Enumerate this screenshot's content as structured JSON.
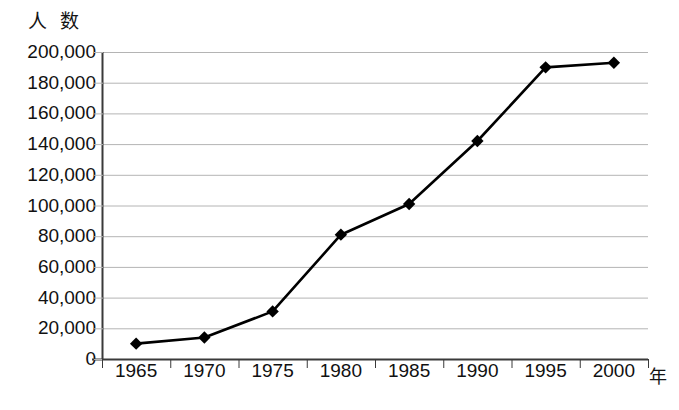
{
  "chart_data": {
    "type": "line",
    "title": "",
    "xlabel": "年",
    "ylabel": "人 数",
    "categories": [
      "1965",
      "1970",
      "1975",
      "1980",
      "1985",
      "1990",
      "1995",
      "2000"
    ],
    "x": [
      1965,
      1970,
      1975,
      1980,
      1985,
      1990,
      1995,
      2000
    ],
    "values": [
      10000,
      14000,
      31000,
      81000,
      101000,
      142000,
      190000,
      193000
    ],
    "series": [
      {
        "name": "人数",
        "values": [
          10000,
          14000,
          31000,
          81000,
          101000,
          142000,
          190000,
          193000
        ]
      }
    ],
    "ylim": [
      0,
      200000
    ],
    "ytick_labels": [
      "200,000",
      "180,000",
      "160,000",
      "140,000",
      "120,000",
      "100,000",
      "80,000",
      "60,000",
      "40,000",
      "20,000",
      "0"
    ],
    "ytick_values": [
      200000,
      180000,
      160000,
      140000,
      120000,
      100000,
      80000,
      60000,
      40000,
      20000,
      0
    ],
    "xtick_labels": [
      "1965",
      "1970",
      "1975",
      "1980",
      "1985",
      "1990",
      "1995",
      "2000"
    ],
    "grid": true,
    "grid_axis": "y",
    "legend": false,
    "marker": "diamond",
    "line_color": "#000000",
    "grid_color": "#b4b4b4",
    "axis_color": "#3a3a3a",
    "background": "#ffffff"
  }
}
